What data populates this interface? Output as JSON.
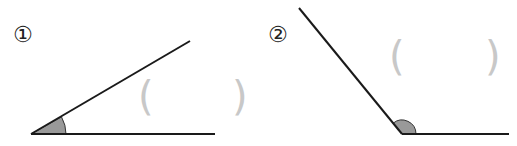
{
  "problems": [
    {
      "label": "①",
      "angle_type": "acute",
      "answer_open": "(",
      "answer_close": ")"
    },
    {
      "label": "②",
      "angle_type": "obtuse",
      "answer_open": "(",
      "answer_close": ")"
    }
  ],
  "colors": {
    "line": "#1a1a1a",
    "angle_fill": "#999999",
    "paren": "#c8c8c8"
  }
}
